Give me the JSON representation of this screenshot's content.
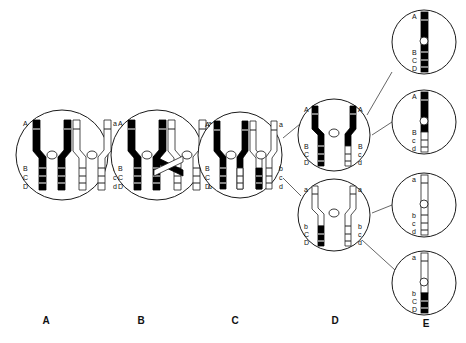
{
  "figure": {
    "stage_labels": [
      {
        "id": "A",
        "label": "A",
        "x": 36,
        "y": 320
      },
      {
        "id": "B",
        "label": "B",
        "x": 131,
        "y": 320
      },
      {
        "id": "C",
        "label": "C",
        "x": 225,
        "y": 320
      },
      {
        "id": "D",
        "label": "D",
        "x": 325,
        "y": 320
      },
      {
        "id": "E",
        "label": "E",
        "x": 416,
        "y": 322
      }
    ],
    "colors": {
      "maternal": "#000000",
      "paternal": "#ffffff",
      "outline": "#1a1a1a",
      "connector": "#555555",
      "text": "#111111"
    },
    "alleles_dark": [
      "A",
      "B",
      "C",
      "D"
    ],
    "alleles_light": [
      "a",
      "b",
      "c",
      "d"
    ],
    "cells": [
      {
        "name": "cell-a",
        "stage": "A",
        "cx": 62,
        "cy": 155,
        "rx": 46,
        "ry": 45,
        "labels_left": [
          "A",
          "B",
          "C",
          "D"
        ],
        "labels_right": [
          "a",
          "b",
          "c",
          "d"
        ]
      },
      {
        "name": "cell-b",
        "stage": "B",
        "cx": 157,
        "cy": 155,
        "rx": 46,
        "ry": 45,
        "labels_left": [
          "A",
          "B",
          "C",
          "D"
        ],
        "labels_right": [
          "a",
          "b",
          "c",
          "d"
        ]
      },
      {
        "name": "cell-c",
        "stage": "C",
        "cx": 240,
        "cy": 155,
        "rx": 42,
        "ry": 43,
        "labels_left": [
          "A",
          "B",
          "C",
          "D"
        ],
        "labels_right": [
          "a",
          "b",
          "c",
          "d"
        ]
      },
      {
        "name": "cell-d-upper",
        "stage": "D",
        "cx": 334,
        "cy": 135,
        "rx": 36,
        "ry": 36,
        "labels_left": [
          "A",
          "B",
          "C",
          "D"
        ],
        "labels_right": [
          "A",
          "B",
          "c",
          "d"
        ]
      },
      {
        "name": "cell-d-lower",
        "stage": "D",
        "cx": 334,
        "cy": 215,
        "rx": 36,
        "ry": 36,
        "labels_left": [
          "a",
          "b",
          "C",
          "D"
        ],
        "labels_right": [
          "a",
          "b",
          "c",
          "d"
        ]
      },
      {
        "name": "cell-e-1",
        "stage": "E",
        "cx": 424,
        "cy": 42,
        "rx": 32,
        "ry": 32,
        "labels_left": [
          "A",
          "B",
          "C",
          "D"
        ]
      },
      {
        "name": "cell-e-2",
        "stage": "E",
        "cx": 424,
        "cy": 122,
        "rx": 32,
        "ry": 32,
        "labels_left": [
          "A",
          "B",
          "c",
          "d"
        ]
      },
      {
        "name": "cell-e-3",
        "stage": "E",
        "cx": 424,
        "cy": 205,
        "rx": 32,
        "ry": 32,
        "labels_left": [
          "a",
          "b",
          "c",
          "d"
        ]
      },
      {
        "name": "cell-e-4",
        "stage": "E",
        "cx": 424,
        "cy": 283,
        "rx": 32,
        "ry": 32,
        "labels_left": [
          "a",
          "b",
          "C",
          "D"
        ]
      }
    ]
  }
}
